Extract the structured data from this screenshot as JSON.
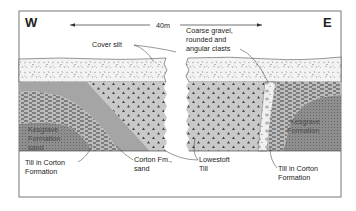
{
  "diagram": {
    "orientation": {
      "west_label": "W",
      "east_label": "E"
    },
    "scale": {
      "label": "40m"
    },
    "labels": {
      "cover_silt": "Cover silt",
      "coarse_gravel_line1": "Coarse gravel,",
      "coarse_gravel_line2": "rounded and",
      "coarse_gravel_line3": "angular clasts",
      "kesgrave_left_line1": "Kesgrave",
      "kesgrave_left_line2": "Formation",
      "kesgrave_left_line3": "sand",
      "kesgrave_right_line1": "Kesgrave",
      "kesgrave_right_line2": "Formation",
      "till_corton_left_line1": "Till in Corton",
      "till_corton_left_line2": "Formation",
      "corton_sand_line1": "Corton Fm.,",
      "corton_sand_line2": "sand",
      "lowestoft_line1": "Lowestoft",
      "lowestoft_line2": "Till",
      "till_corton_right_line1": "Till in Corton",
      "till_corton_right_line2": "Formation"
    },
    "colors": {
      "frame": "#555555",
      "gravel_fill": "#f2f2f2",
      "lowestoft_fill": "#c8c8c8",
      "corton_sand_fill": "#a6a6a6",
      "till_fill": "#bdbdbd",
      "kesgrave_fill": "#8f8f8f"
    }
  }
}
